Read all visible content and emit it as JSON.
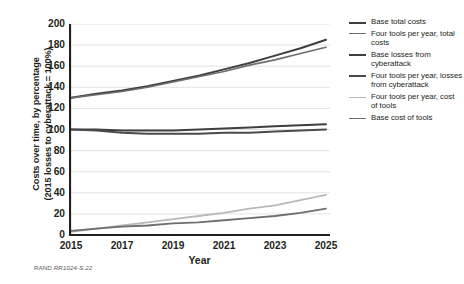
{
  "figure": {
    "credit_org": "RAND",
    "credit_id": "RR1024-S.22"
  },
  "chart_data": {
    "type": "line",
    "title": "",
    "xlabel": "Year",
    "ylabel": "Costs over time, by percentage (2015 losses to cyberattack = 100%)",
    "ylabel_line1": "Costs over time, by percentage",
    "ylabel_line2": "(2015 losses to cyberattack = 100%)",
    "x": [
      2015,
      2016,
      2017,
      2018,
      2019,
      2020,
      2021,
      2022,
      2023,
      2024,
      2025
    ],
    "xlim": [
      2015,
      2025
    ],
    "ylim": [
      0,
      200
    ],
    "yticks": [
      0,
      20,
      40,
      60,
      80,
      100,
      120,
      140,
      160,
      180,
      200
    ],
    "xticks": [
      2015,
      2017,
      2019,
      2021,
      2023,
      2025
    ],
    "xticks_minor": [
      2015,
      2016,
      2017,
      2018,
      2019,
      2020,
      2021,
      2022,
      2023,
      2024,
      2025
    ],
    "grid": "horizontal",
    "legend_position": "right",
    "series": [
      {
        "name": "Base total costs",
        "color": "#3f3f3f",
        "width": 2.0,
        "values": [
          130,
          134,
          137,
          141,
          146,
          151,
          157,
          163,
          170,
          177,
          185
        ]
      },
      {
        "name": "Four tools per year, total costs",
        "color": "#6e6e6e",
        "width": 1.6,
        "values": [
          130,
          133,
          136,
          140,
          145,
          150,
          155,
          161,
          166,
          172,
          178
        ]
      },
      {
        "name": "Base losses from cyberattack",
        "color": "#3f3f3f",
        "width": 2.0,
        "values": [
          100,
          100,
          99,
          99,
          99,
          100,
          101,
          102,
          103,
          104,
          105
        ]
      },
      {
        "name": "Four tools per year, losses from cyberattack",
        "color": "#4a4a4a",
        "width": 2.0,
        "values": [
          100,
          99,
          97,
          96,
          96,
          96,
          97,
          97,
          98,
          99,
          100
        ]
      },
      {
        "name": "Four tools per year, cost of tools",
        "color": "#b9b9b9",
        "width": 1.8,
        "values": [
          3,
          6,
          9,
          12,
          15,
          18,
          21,
          25,
          28,
          33,
          38
        ]
      },
      {
        "name": "Base cost of tools",
        "color": "#6e6e6e",
        "width": 1.8,
        "values": [
          4,
          6,
          8,
          9,
          11,
          12,
          14,
          16,
          18,
          21,
          25
        ]
      }
    ]
  }
}
